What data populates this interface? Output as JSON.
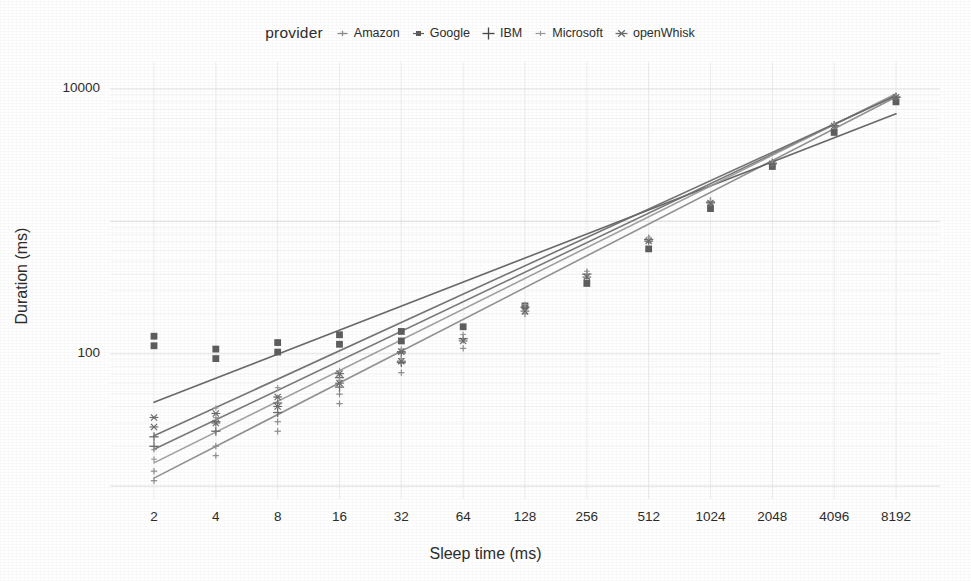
{
  "chart_data": {
    "type": "scatter",
    "title": "",
    "subtitle": "",
    "xlabel": "Sleep time (ms)",
    "ylabel": "Duration (ms)",
    "x_scale": "log2",
    "y_scale": "log10",
    "grid": true,
    "legend_position": "top",
    "legend_title": "provider",
    "x_ticks": [
      "2",
      "4",
      "8",
      "16",
      "32",
      "64",
      "128",
      "256",
      "512",
      "1024",
      "2048",
      "4096",
      "8192"
    ],
    "x_tick_values": [
      2,
      4,
      8,
      16,
      32,
      64,
      128,
      256,
      512,
      1024,
      2048,
      4096,
      8192
    ],
    "y_ticks": [
      "100",
      "10000"
    ],
    "y_tick_values": [
      100,
      10000
    ],
    "ylim": [
      8,
      16000
    ],
    "xlim": [
      2,
      8192
    ],
    "series": [
      {
        "name": "Amazon",
        "marker": "thin-plus",
        "color": "#8a8a8a",
        "x": [
          2,
          4,
          8,
          16,
          32,
          64,
          128,
          256,
          512,
          1024,
          2048,
          4096,
          8192
        ],
        "values": [
          11,
          17,
          26,
          42,
          72,
          110,
          200,
          370,
          700,
          1350,
          2700,
          5300,
          8600
        ]
      },
      {
        "name": "Google",
        "marker": "filled-square",
        "color": "#5e5e5e",
        "x": [
          2,
          4,
          8,
          16,
          32,
          64,
          128,
          256,
          512,
          1024,
          2048,
          4096,
          8192
        ],
        "values": [
          115,
          92,
          103,
          118,
          125,
          160,
          230,
          340,
          620,
          1250,
          2600,
          4700,
          8000
        ]
      },
      {
        "name": "IBM",
        "marker": "plus",
        "color": "#707070",
        "x": [
          2,
          4,
          8,
          16,
          32,
          64,
          128,
          256,
          512,
          1024,
          2048,
          4096,
          8192
        ],
        "values": [
          20,
          26,
          36,
          56,
          86,
          130,
          225,
          400,
          730,
          1400,
          2750,
          5300,
          8700
        ]
      },
      {
        "name": "Microsoft",
        "marker": "small-plus",
        "color": "#9a9a9a",
        "x": [
          2,
          4,
          8,
          16,
          32,
          64,
          128,
          256,
          512,
          1024,
          2048,
          4096,
          8192
        ],
        "values": [
          16,
          33,
          47,
          63,
          92,
          140,
          235,
          420,
          760,
          1420,
          2780,
          5400,
          8800
        ]
      },
      {
        "name": "openWhisk",
        "marker": "asterisk",
        "color": "#6b6b6b",
        "x": [
          2,
          4,
          8,
          16,
          32,
          64,
          128,
          256,
          512,
          1024,
          2048,
          4096,
          8192
        ],
        "values": [
          28,
          30,
          40,
          60,
          88,
          125,
          210,
          380,
          710,
          1380,
          2720,
          5250,
          8650
        ]
      }
    ],
    "fit_lines": [
      {
        "name": "Amazon",
        "x0": 2,
        "y0": 11.5,
        "x1": 8192,
        "y1": 8700
      },
      {
        "name": "Google",
        "x0": 2,
        "y0": 43,
        "x1": 8192,
        "y1": 6500
      },
      {
        "name": "IBM",
        "x0": 2,
        "y0": 19,
        "x1": 8192,
        "y1": 9000
      },
      {
        "name": "Microsoft",
        "x0": 2,
        "y0": 15,
        "x1": 8192,
        "y1": 9200
      },
      {
        "name": "openWhisk",
        "x0": 2,
        "y0": 24,
        "x1": 8192,
        "y1": 8900
      }
    ]
  },
  "legend": {
    "title": "provider",
    "items": [
      {
        "label": "Amazon",
        "key": "thin-plus"
      },
      {
        "label": "Google",
        "key": "filled-square"
      },
      {
        "label": "IBM",
        "key": "plus"
      },
      {
        "label": "Microsoft",
        "key": "small-plus"
      },
      {
        "label": "openWhisk",
        "key": "asterisk"
      }
    ]
  },
  "axes": {
    "x_title": "Sleep time (ms)",
    "y_title": "Duration (ms)"
  },
  "colors": {
    "background": "#ffffff",
    "text": "#2d2d2d",
    "grid": "#ededed",
    "line": "#6f6f6f"
  }
}
